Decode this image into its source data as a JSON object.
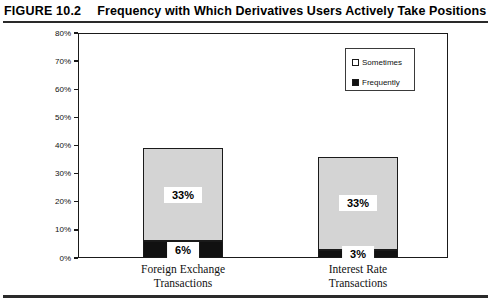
{
  "figure": {
    "number": "FIGURE 10.2",
    "title": "Frequency with Which Derivatives Users Actively Take Positions"
  },
  "chart_data": {
    "type": "bar",
    "stacked": true,
    "title": "Frequency with Which Derivatives Users Actively Take Positions",
    "xlabel": "",
    "ylabel": "",
    "ylim": [
      0,
      80
    ],
    "ytick_labels": [
      "0%",
      "10%",
      "20%",
      "30%",
      "40%",
      "50%",
      "60%",
      "70%",
      "80%"
    ],
    "ytick_values": [
      0,
      10,
      20,
      30,
      40,
      50,
      60,
      70,
      80
    ],
    "grid": false,
    "legend_position": "top-right",
    "categories": [
      "Foreign Exchange Transactions",
      "Interest Rate Transactions"
    ],
    "category_lines": [
      [
        "Foreign Exchange",
        "Transactions"
      ],
      [
        "Interest Rate",
        "Transactions"
      ]
    ],
    "series": [
      {
        "name": "Frequently",
        "color": "#111111",
        "values": [
          6,
          3
        ],
        "labels": [
          "6%",
          "3%"
        ]
      },
      {
        "name": "Sometimes",
        "color": "#d4d4d4",
        "values": [
          33,
          33
        ],
        "labels": [
          "33%",
          "33%"
        ]
      }
    ],
    "totals": [
      39,
      36
    ]
  },
  "legend": {
    "items": [
      {
        "label": "Sometimes",
        "swatch": "hollow-square-icon"
      },
      {
        "label": "Frequently",
        "swatch": "filled-square-icon"
      }
    ]
  }
}
